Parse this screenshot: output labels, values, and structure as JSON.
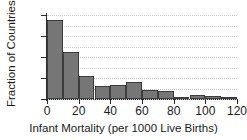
{
  "chart_data": {
    "type": "bar",
    "title": "",
    "subtitle": "",
    "xlabel": "Infant Mortality (per 1000 Live Births)",
    "ylabel": "Fraction of Countries",
    "xlim": [
      0,
      120
    ],
    "ylim": [
      0,
      0.4
    ],
    "bin_width": 10,
    "grid": true,
    "legend": false,
    "legend_position": "none",
    "bar_color": "#767676",
    "bar_edge_color": "#3d3d3d",
    "axis_color": "#2a2a2a",
    "grid_color": "#c9c9cf",
    "background": "#ffffff",
    "xtick_labels": [
      "0",
      "20",
      "40",
      "60",
      "80",
      "100",
      "120"
    ],
    "xticks": [
      0,
      20,
      40,
      60,
      80,
      100,
      120
    ],
    "ytick_labels": [
      "0",
      "0.1",
      "0.2",
      "0.3",
      "0.4"
    ],
    "yticks": [
      0,
      0.1,
      0.2,
      0.3,
      0.4
    ],
    "categories": [
      "0-10",
      "10-20",
      "20-30",
      "30-40",
      "40-50",
      "50-60",
      "60-70",
      "70-80",
      "80-90",
      "90-100",
      "100-110",
      "110-120"
    ],
    "bin_edges": [
      0,
      10,
      20,
      30,
      40,
      50,
      60,
      70,
      80,
      90,
      100,
      110,
      120
    ],
    "values": [
      0.375,
      0.224,
      0.11,
      0.062,
      0.067,
      0.081,
      0.043,
      0.038,
      0.01,
      0.021,
      0.016,
      0.011
    ]
  }
}
